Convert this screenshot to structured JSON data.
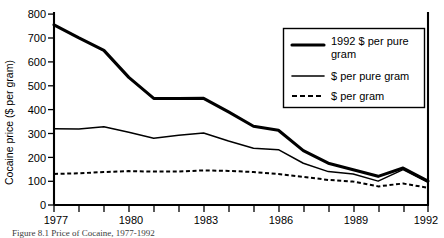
{
  "figure": {
    "caption": "Figure 8.1    Price of Cocaine, 1977-1992"
  },
  "chart_data": {
    "type": "line",
    "title": "",
    "xlabel": "",
    "ylabel": "Cocaine price ($ per gram)",
    "xlim": [
      1977,
      1992
    ],
    "ylim": [
      0,
      800
    ],
    "grid": false,
    "legend_position": "top-right",
    "x": [
      1977,
      1978,
      1979,
      1980,
      1981,
      1982,
      1983,
      1984,
      1985,
      1986,
      1987,
      1988,
      1989,
      1990,
      1991,
      1992
    ],
    "x_tick_labels": [
      "1977",
      "1980",
      "1983",
      "1986",
      "1989",
      "1992"
    ],
    "x_tick_values": [
      1977,
      1980,
      1983,
      1986,
      1989,
      1992
    ],
    "y_tick_labels": [
      "0",
      "100",
      "200",
      "300",
      "400",
      "500",
      "600",
      "700",
      "800"
    ],
    "y_tick_values": [
      0,
      100,
      200,
      300,
      400,
      500,
      600,
      700,
      800
    ],
    "series": [
      {
        "name": "1992 $ per pure gram",
        "style": "thick-solid",
        "values": [
          755,
          700,
          648,
          535,
          447,
          446,
          447,
          390,
          330,
          313,
          228,
          175,
          148,
          120,
          155,
          100
        ]
      },
      {
        "name": "$ per pure gram",
        "style": "thin-solid",
        "values": [
          320,
          318,
          328,
          305,
          280,
          292,
          302,
          268,
          238,
          232,
          175,
          140,
          130,
          100,
          148,
          95
        ]
      },
      {
        "name": "$ per gram",
        "style": "dashed",
        "values": [
          130,
          133,
          138,
          142,
          140,
          140,
          145,
          143,
          138,
          130,
          118,
          105,
          98,
          78,
          90,
          72
        ]
      }
    ]
  },
  "legend": {
    "entries": [
      {
        "label": "1992 $ per pure gram",
        "style": "thick-solid"
      },
      {
        "label": "$ per pure gram",
        "style": "thin-solid"
      },
      {
        "label": "$ per gram",
        "style": "dashed"
      }
    ]
  }
}
